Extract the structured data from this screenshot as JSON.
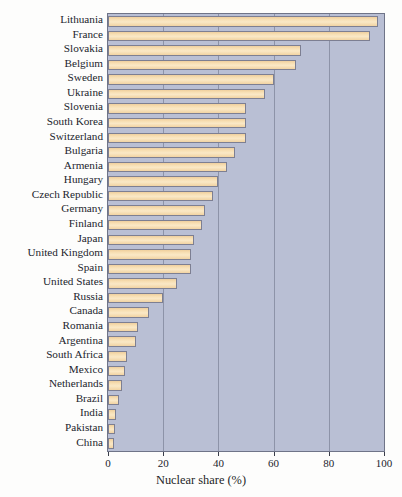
{
  "chart_data": {
    "type": "bar",
    "orientation": "horizontal",
    "title": "",
    "subtitle": "",
    "xlabel": "Nuclear share (%)",
    "ylabel": "",
    "xlim": [
      0,
      100
    ],
    "ylim": null,
    "grid": true,
    "legend": null,
    "xticks": [
      0,
      20,
      40,
      60,
      80,
      100
    ],
    "xtick_labels": [
      "0",
      "20",
      "40",
      "60",
      "80",
      "100"
    ],
    "categories": [
      "Lithuania",
      "France",
      "Slovakia",
      "Belgium",
      "Sweden",
      "Ukraine",
      "Slovenia",
      "South Korea",
      "Switzerland",
      "Bulgaria",
      "Armenia",
      "Hungary",
      "Czech Republic",
      "Germany",
      "Finland",
      "Japan",
      "United Kingdom",
      "Spain",
      "United States",
      "Russia",
      "Canada",
      "Romania",
      "Argentina",
      "South Africa",
      "Mexico",
      "Netherlands",
      "Brazil",
      "India",
      "Pakistan",
      "China"
    ],
    "values": [
      98,
      95,
      70,
      68,
      60,
      57,
      50,
      50,
      50,
      46,
      43,
      40,
      38,
      35,
      34,
      31,
      30,
      30,
      25,
      20,
      15,
      11,
      10,
      7,
      6,
      5,
      4,
      3,
      2.5,
      2
    ],
    "series": [
      {
        "name": "Nuclear share",
        "values": [
          98,
          95,
          70,
          68,
          60,
          57,
          50,
          50,
          50,
          46,
          43,
          40,
          38,
          35,
          34,
          31,
          30,
          30,
          25,
          20,
          15,
          11,
          10,
          7,
          6,
          5,
          4,
          3,
          2.5,
          2
        ]
      }
    ],
    "colors": {
      "bar_fill": "#f5d9a8",
      "bar_edge": "#7d7f92",
      "plot_background": "#b9bfd4",
      "gridline": "#8d93a8",
      "text": "#22242c",
      "axis": "#3a3d49"
    }
  }
}
